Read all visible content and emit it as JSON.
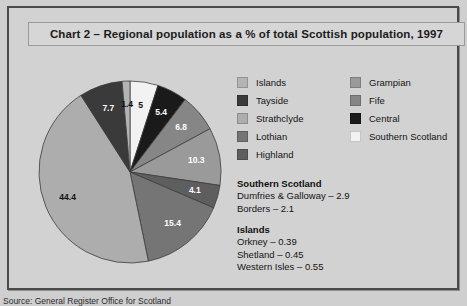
{
  "title": "Chart 2 – Regional population as a % of total Scottish population, 1997",
  "source": "Source: General Register Office for Scotland",
  "colors": {
    "islands": "#b4b4b4",
    "tayside": "#3a3a3a",
    "strathclyde": "#adadad",
    "lothian": "#757575",
    "highland": "#5e5e5e",
    "grampian": "#9a9a9a",
    "fife": "#868686",
    "central": "#1a1a1a",
    "southern_scotland": "#f2f2f2",
    "frame_border": "#4a4a4a",
    "background": "#d2d2d2"
  },
  "legend": {
    "left_column": [
      {
        "label": "Islands",
        "key": "islands"
      },
      {
        "label": "Tayside",
        "key": "tayside"
      },
      {
        "label": "Strathclyde",
        "key": "strathclyde"
      },
      {
        "label": "Lothian",
        "key": "lothian"
      },
      {
        "label": "Highland",
        "key": "highland"
      }
    ],
    "right_column": [
      {
        "label": "Grampian",
        "key": "grampian"
      },
      {
        "label": "Fife",
        "key": "fife"
      },
      {
        "label": "Central",
        "key": "central"
      },
      {
        "label": "Southern Scotland",
        "key": "southern_scotland"
      }
    ]
  },
  "notes": [
    {
      "heading": "Southern Scotland",
      "lines": [
        "Dumfries & Galloway – 2.9",
        "Borders – 2.1"
      ]
    },
    {
      "heading": "Islands",
      "lines": [
        "Orkney – 0.39",
        "Shetland – 0.45",
        "Western Isles – 0.55"
      ]
    }
  ],
  "chart_data": {
    "type": "pie",
    "title": "Chart 2 – Regional population as a % of total Scottish population, 1997",
    "unit": "percent",
    "start_angle_deg": 0,
    "direction": "clockwise",
    "legend_position": "right",
    "labels": [
      "Southern Scotland",
      "Central",
      "Fife",
      "Grampian",
      "Highland",
      "Lothian",
      "Strathclyde",
      "Tayside",
      "Islands"
    ],
    "values": [
      5,
      5.4,
      6.8,
      10.3,
      4.1,
      15.4,
      44.4,
      7.7,
      1.4
    ],
    "slices": [
      {
        "name": "Southern Scotland",
        "value": 5,
        "display": "5",
        "color": "#f2f2f2",
        "label_color": "#111111"
      },
      {
        "name": "Central",
        "value": 5.4,
        "display": "5.4",
        "color": "#1a1a1a",
        "label_color": "#ffffff"
      },
      {
        "name": "Fife",
        "value": 6.8,
        "display": "6.8",
        "color": "#868686",
        "label_color": "#ffffff"
      },
      {
        "name": "Grampian",
        "value": 10.3,
        "display": "10.3",
        "color": "#9a9a9a",
        "label_color": "#ffffff"
      },
      {
        "name": "Highland",
        "value": 4.1,
        "display": "4.1",
        "color": "#5e5e5e",
        "label_color": "#ffffff"
      },
      {
        "name": "Lothian",
        "value": 15.4,
        "display": "15.4",
        "color": "#757575",
        "label_color": "#ffffff"
      },
      {
        "name": "Strathclyde",
        "value": 44.4,
        "display": "44.4",
        "color": "#adadad",
        "label_color": "#111111"
      },
      {
        "name": "Tayside",
        "value": 7.7,
        "display": "7.7",
        "color": "#3a3a3a",
        "label_color": "#ffffff"
      },
      {
        "name": "Islands",
        "value": 1.4,
        "display": "1.4",
        "color": "#b4b4b4",
        "label_color": "#111111"
      }
    ]
  }
}
